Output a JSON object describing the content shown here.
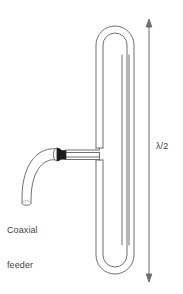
{
  "figure": {
    "type": "antenna-schematic",
    "background_color": "#ffffff",
    "line_color": "#6f6f6f",
    "connector_color": "#1a1a1a",
    "text_color": "#3f3f3f"
  },
  "labels": {
    "coaxial_feeder_line1": "Coaxial",
    "coaxial_feeder_line2": "feeder",
    "half_wavelength": "λ/2"
  },
  "annotations": {
    "dimension_arrow": {
      "name": "half-wavelength-dimension",
      "orientation": "vertical",
      "double_headed": true,
      "label": "λ/2",
      "x": 149,
      "y_top": 20,
      "y_bottom": 281
    }
  },
  "elements": {
    "folded_dipole_loop": "folded-dipole-loop",
    "feed_gap": "feed-gap",
    "coax_cable": "coaxial-cable",
    "coax_connector": "coax-connector-ferrule",
    "feed_line_upper": "feed-line-upper",
    "feed_line_lower": "feed-line-lower"
  }
}
